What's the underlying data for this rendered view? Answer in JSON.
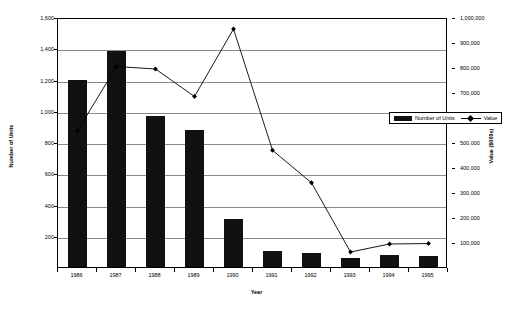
{
  "chart_data": {
    "type": "bar",
    "title": "",
    "subtitle": "",
    "xlabel": "Year",
    "ylabel": "Number of Units",
    "y2label": "Value ($000s)",
    "categories": [
      "1986",
      "1987",
      "1988",
      "1989",
      "1990",
      "1991",
      "1992",
      "1993",
      "1994",
      "1995"
    ],
    "grid": true,
    "legend_position": "inside-right",
    "ylim": [
      0,
      1600
    ],
    "y2lim": [
      0,
      1000000
    ],
    "yticks": [
      "200",
      "400",
      "600",
      "800",
      "1,000",
      "1,200",
      "1,400",
      "1,600"
    ],
    "ytick_values": [
      200,
      400,
      600,
      800,
      1000,
      1200,
      1400,
      1600
    ],
    "y2ticks": [
      "100,000",
      "200,000",
      "300,000",
      "400,000",
      "500,000",
      "600,000",
      "700,000",
      "800,000",
      "900,000",
      "1,000,000"
    ],
    "y2tick_values": [
      100000,
      200000,
      300000,
      400000,
      500000,
      600000,
      700000,
      800000,
      900000,
      1000000
    ],
    "series": [
      {
        "name": "Number of Units",
        "type": "bar",
        "axis": "left",
        "color": "#111111",
        "values": [
          1200,
          1385,
          965,
          880,
          305,
          105,
          88,
          55,
          75,
          72
        ]
      },
      {
        "name": "Value",
        "type": "line",
        "axis": "right",
        "color": "#000000",
        "marker": "diamond",
        "values": [
          553000,
          810000,
          800000,
          690000,
          960000,
          475000,
          345000,
          68000,
          100000,
          102000
        ]
      }
    ]
  },
  "legend": {
    "entries": [
      {
        "label": "Number of Units",
        "swatch": "bar-swatch"
      },
      {
        "label": "Value",
        "swatch": "line-marker-swatch"
      }
    ]
  },
  "axes": {
    "x_title": "Year",
    "y_left_title": "Number of Units",
    "y_right_title": "Value ($000s)"
  },
  "colors": {
    "bar": "#111111",
    "line": "#000000",
    "grid": "#8a8a8a",
    "frame": "#000000",
    "background": "#ffffff"
  }
}
